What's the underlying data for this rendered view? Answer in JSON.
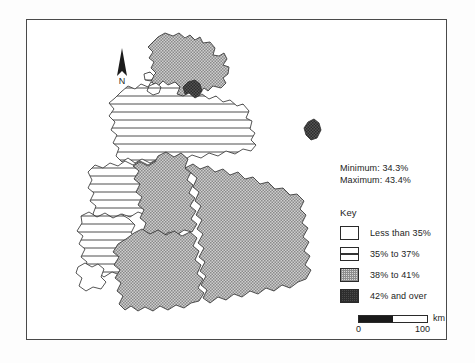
{
  "map": {
    "title_region": "West Germany",
    "north_arrow_label": "N",
    "statistics": {
      "minimum_label": "Minimum: 34.3%",
      "maximum_label": "Maximum: 43.4%",
      "minimum_value": 34.3,
      "maximum_value": 43.4
    },
    "legend": {
      "title": "Key",
      "classes": [
        {
          "label": "Less than 35%",
          "pattern": "white",
          "color": "#ffffff"
        },
        {
          "label": "35% to 37%",
          "pattern": "horizontal-lines",
          "color": "#ffffff"
        },
        {
          "label": "38% to 41%",
          "pattern": "stipple-gray",
          "color": "#a9a9a9"
        },
        {
          "label": "42% and over",
          "pattern": "solid-dark",
          "color": "#4a4a4a"
        }
      ]
    },
    "scale": {
      "unit": "km",
      "tick_start": "0",
      "tick_end": "100",
      "length_km": 100
    },
    "regions": [
      {
        "name": "Schleswig-Holstein",
        "class": "38% to 41%"
      },
      {
        "name": "Hamburg",
        "class": "42% and over"
      },
      {
        "name": "Bremen",
        "class": "35% to 37%"
      },
      {
        "name": "Niedersachsen",
        "class": "35% to 37%"
      },
      {
        "name": "Nordrhein-Westfalen",
        "class": "35% to 37%"
      },
      {
        "name": "Rheinland-Pfalz",
        "class": "35% to 37%"
      },
      {
        "name": "Saarland",
        "class": "Less than 35%"
      },
      {
        "name": "Hessen",
        "class": "38% to 41%"
      },
      {
        "name": "Baden-Wurttemberg",
        "class": "38% to 41%"
      },
      {
        "name": "Bayern",
        "class": "38% to 41%"
      },
      {
        "name": "West Berlin",
        "class": "42% and over"
      }
    ]
  }
}
